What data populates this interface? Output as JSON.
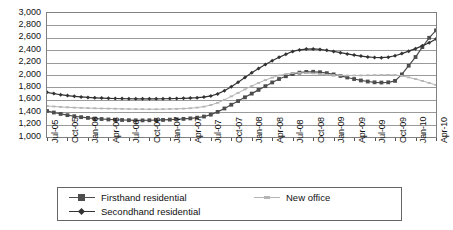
{
  "chart_data": {
    "type": "line",
    "title": "",
    "xlabel": "",
    "ylabel": "",
    "ylim": [
      1000,
      3000
    ],
    "ytick_step": 200,
    "grid": true,
    "legend_position": "bottom",
    "y_ticks": [
      "3,000",
      "2,800",
      "2,600",
      "2,400",
      "2,200",
      "2,000",
      "1,800",
      "1,600",
      "1,400",
      "1,200",
      "1,000"
    ],
    "x_tick_labels": [
      "Jul-05",
      "Oct-05",
      "Jan-06",
      "Apr-06",
      "Jul-06",
      "Oct-06",
      "Jan-07",
      "Apr-07",
      "Jul-07",
      "Oct-07",
      "Jan-08",
      "Apr-08",
      "Jul-08",
      "Oct-08",
      "Jan-09",
      "Apr-09",
      "Jul-09",
      "Oct-09",
      "Jan-10",
      "Apr-10"
    ],
    "x_points": [
      "Jul-05",
      "Aug-05",
      "Sep-05",
      "Oct-05",
      "Nov-05",
      "Dec-05",
      "Jan-06",
      "Feb-06",
      "Mar-06",
      "Apr-06",
      "May-06",
      "Jun-06",
      "Jul-06",
      "Aug-06",
      "Sep-06",
      "Oct-06",
      "Nov-06",
      "Dec-06",
      "Jan-07",
      "Feb-07",
      "Mar-07",
      "Apr-07",
      "May-07",
      "Jun-07",
      "Jul-07",
      "Aug-07",
      "Sep-07",
      "Oct-07",
      "Nov-07",
      "Dec-07",
      "Jan-08",
      "Feb-08",
      "Mar-08",
      "Apr-08",
      "May-08",
      "Jun-08",
      "Jul-08",
      "Aug-08",
      "Sep-08",
      "Oct-08",
      "Nov-08",
      "Dec-08",
      "Jan-09",
      "Feb-09",
      "Mar-09",
      "Apr-09",
      "May-09",
      "Jun-09",
      "Jul-09",
      "Aug-09",
      "Sep-09",
      "Oct-09",
      "Nov-09",
      "Dec-09",
      "Jan-10",
      "Feb-10",
      "Mar-10",
      "Apr-10"
    ],
    "series": [
      {
        "name": "Firsthand residential",
        "color": "#4d4d4d",
        "marker": "square",
        "values": [
          1420,
          1395,
          1372,
          1352,
          1335,
          1320,
          1308,
          1298,
          1290,
          1283,
          1278,
          1274,
          1271,
          1269,
          1268,
          1270,
          1272,
          1275,
          1280,
          1286,
          1292,
          1300,
          1312,
          1330,
          1360,
          1405,
          1460,
          1520,
          1580,
          1640,
          1700,
          1760,
          1820,
          1880,
          1935,
          1980,
          2015,
          2038,
          2050,
          2052,
          2045,
          2030,
          2010,
          1985,
          1960,
          1935,
          1912,
          1895,
          1882,
          1878,
          1882,
          1905,
          2010,
          2150,
          2290,
          2450,
          2600,
          2720,
          2850
        ]
      },
      {
        "name": "Secondhand residential",
        "color": "#333333",
        "marker": "diamond",
        "values": [
          1720,
          1700,
          1682,
          1668,
          1656,
          1646,
          1638,
          1632,
          1628,
          1624,
          1621,
          1619,
          1617,
          1616,
          1615,
          1615,
          1616,
          1617,
          1619,
          1621,
          1624,
          1628,
          1634,
          1644,
          1662,
          1695,
          1745,
          1810,
          1885,
          1960,
          2035,
          2105,
          2170,
          2230,
          2285,
          2335,
          2380,
          2405,
          2418,
          2420,
          2412,
          2398,
          2380,
          2360,
          2340,
          2322,
          2305,
          2292,
          2282,
          2280,
          2288,
          2310,
          2345,
          2385,
          2425,
          2470,
          2520,
          2580,
          2650
        ]
      },
      {
        "name": "New office",
        "color": "#b5b5b5",
        "marker": "dash",
        "values": [
          1500,
          1492,
          1485,
          1479,
          1474,
          1470,
          1466,
          1463,
          1460,
          1458,
          1456,
          1454,
          1452,
          1450,
          1449,
          1448,
          1448,
          1449,
          1451,
          1454,
          1458,
          1464,
          1474,
          1490,
          1515,
          1552,
          1600,
          1655,
          1712,
          1768,
          1822,
          1872,
          1918,
          1958,
          1992,
          2015,
          2030,
          2035,
          2032,
          2025,
          2015,
          2005,
          1998,
          1994,
          1992,
          1992,
          1993,
          1995,
          1998,
          2000,
          2002,
          2000,
          1985,
          1962,
          1935,
          1905,
          1872,
          1840,
          1800
        ]
      }
    ]
  },
  "legend": {
    "entries": [
      {
        "label": "Firsthand residential"
      },
      {
        "label": "Secondhand residential"
      },
      {
        "label": "New office"
      }
    ]
  }
}
